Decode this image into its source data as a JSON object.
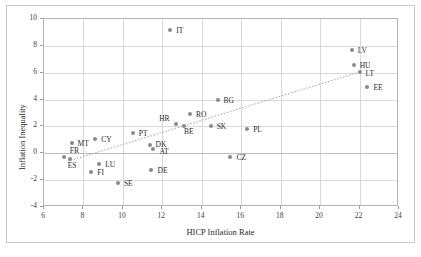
{
  "chart_data": {
    "type": "scatter",
    "title": "",
    "xlabel": "HICP Inflation Rate",
    "ylabel": "Inflation Inequality",
    "xlim": [
      6,
      24
    ],
    "ylim": [
      -4,
      10
    ],
    "xticks": [
      6,
      8,
      10,
      12,
      14,
      16,
      18,
      20,
      22,
      24
    ],
    "yticks": [
      -4,
      -2,
      0,
      2,
      4,
      6,
      8,
      10
    ],
    "xtick_labels": [
      "6",
      "8",
      "10",
      "12",
      "14",
      "16",
      "18",
      "20",
      "22",
      "24"
    ],
    "ytick_labels": [
      "-4",
      "-2",
      "0",
      "2",
      "4",
      "6",
      "8",
      "10"
    ],
    "grid": true,
    "legend": "none",
    "marker_color": "#8a8a8a",
    "trendline_color": "#a8a8a8",
    "trendline": {
      "x": [
        7.2,
        22.0
      ],
      "y": [
        -0.6,
        6.05
      ],
      "style": "dotted"
    },
    "points": [
      {
        "label": "FR",
        "x": 7.0,
        "y": -0.3,
        "lx": 6,
        "ly": -6
      },
      {
        "label": "ES",
        "x": 7.3,
        "y": -0.45,
        "lx": -2,
        "ly": 7
      },
      {
        "label": "MT",
        "x": 7.4,
        "y": 0.75,
        "lx": 6,
        "ly": 1
      },
      {
        "label": "FI",
        "x": 8.4,
        "y": -1.4,
        "lx": 6,
        "ly": 1
      },
      {
        "label": "CY",
        "x": 8.6,
        "y": 1.1,
        "lx": 6,
        "ly": 1
      },
      {
        "label": "LU",
        "x": 8.8,
        "y": -0.8,
        "lx": 6,
        "ly": 1
      },
      {
        "label": "SE",
        "x": 9.75,
        "y": -2.2,
        "lx": 6,
        "ly": 1
      },
      {
        "label": "PT",
        "x": 10.5,
        "y": 1.5,
        "lx": 6,
        "ly": 1
      },
      {
        "label": "DK",
        "x": 11.35,
        "y": 0.65,
        "lx": 6,
        "ly": 0
      },
      {
        "label": "DE",
        "x": 11.45,
        "y": -1.25,
        "lx": 6,
        "ly": 1
      },
      {
        "label": "AT",
        "x": 11.55,
        "y": 0.35,
        "lx": 6,
        "ly": 3
      },
      {
        "label": "IT",
        "x": 12.4,
        "y": 9.2,
        "lx": 6,
        "ly": 1
      },
      {
        "label": "HR",
        "x": 12.7,
        "y": 2.2,
        "lx": -17,
        "ly": -5
      },
      {
        "label": "BE",
        "x": 13.1,
        "y": 2.0,
        "lx": 0,
        "ly": 6
      },
      {
        "label": "RO",
        "x": 13.4,
        "y": 2.9,
        "lx": 6,
        "ly": 1
      },
      {
        "label": "SK",
        "x": 14.45,
        "y": 2.05,
        "lx": 6,
        "ly": 1
      },
      {
        "label": "BG",
        "x": 14.8,
        "y": 3.95,
        "lx": 6,
        "ly": 1
      },
      {
        "label": "CZ",
        "x": 15.45,
        "y": -0.25,
        "lx": 6,
        "ly": 1
      },
      {
        "label": "PL",
        "x": 16.3,
        "y": 1.8,
        "lx": 6,
        "ly": 1
      },
      {
        "label": "LV",
        "x": 21.6,
        "y": 7.7,
        "lx": 6,
        "ly": 1
      },
      {
        "label": "HU",
        "x": 21.7,
        "y": 6.6,
        "lx": 6,
        "ly": 1
      },
      {
        "label": "LT",
        "x": 22.0,
        "y": 6.05,
        "lx": 6,
        "ly": 2
      },
      {
        "label": "EE",
        "x": 22.4,
        "y": 4.9,
        "lx": 6,
        "ly": 1
      }
    ]
  }
}
